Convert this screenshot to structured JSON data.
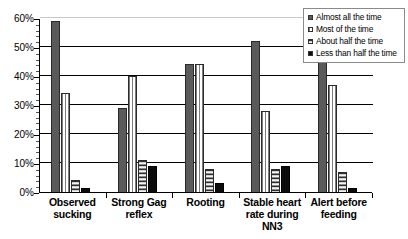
{
  "chart_data": {
    "type": "bar",
    "title": "",
    "subtitle": "",
    "xlabel": "",
    "ylabel": "",
    "ylim": [
      0,
      60
    ],
    "yticks": [
      "0%",
      "10%",
      "20%",
      "30%",
      "40%",
      "50%",
      "60%"
    ],
    "ytick_values": [
      0,
      10,
      20,
      30,
      40,
      50,
      60
    ],
    "grid": true,
    "legend_position": "top-right",
    "categories": [
      "Observed sucking",
      "Strong Gag reflex",
      "Rooting",
      "Stable heart rate during NN3",
      "Alert before feeding"
    ],
    "category_lines": [
      [
        "Observed",
        "sucking"
      ],
      [
        "Strong Gag",
        "reflex"
      ],
      [
        "Rooting"
      ],
      [
        "Stable heart",
        "rate during",
        "NN3"
      ],
      [
        "Alert before",
        "feeding"
      ]
    ],
    "series": [
      {
        "name": "Almost all the time",
        "pattern": "solid-dark-gray",
        "color": "#5a5a5a",
        "values": [
          59,
          29,
          44,
          52,
          54
        ]
      },
      {
        "name": "Most of the time",
        "pattern": "vertical-stripes",
        "color": "#f2f2f2",
        "values": [
          34,
          40,
          44,
          28,
          37
        ]
      },
      {
        "name": "About half the time",
        "pattern": "horizontal-stripes",
        "color": "#b5b5b5",
        "values": [
          4,
          11,
          8,
          8,
          7
        ]
      },
      {
        "name": "Less than half the time",
        "pattern": "solid-black",
        "color": "#0c0c0c",
        "values": [
          1.5,
          9,
          3,
          9,
          1.5
        ]
      }
    ]
  },
  "legend": {
    "items": [
      {
        "label": "Almost all the time"
      },
      {
        "label": "Most of the time"
      },
      {
        "label": "About half the time"
      },
      {
        "label": "Less than half the time"
      }
    ]
  }
}
